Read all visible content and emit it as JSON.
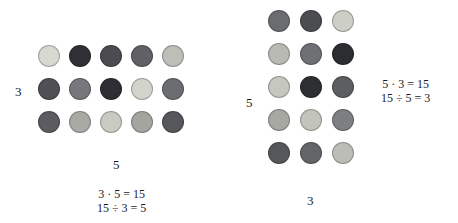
{
  "diagram": {
    "type": "array-model-multiplication",
    "left_array": {
      "rows": 3,
      "cols": 5,
      "row_label": "3",
      "col_label": "5",
      "equations": [
        "3 · 5 = 15",
        "15 ÷ 3 = 5"
      ],
      "dot_colors": [
        [
          "#d8d8d0",
          "#2f3033",
          "#4a4c50",
          "#5f6165",
          "#bdbeb8"
        ],
        [
          "#4e5054",
          "#76787c",
          "#2e2f32",
          "#d2d3cb",
          "#6b6d71"
        ],
        [
          "#5a5c60",
          "#a9aaa4",
          "#c9cac2",
          "#a4a59f",
          "#55575b"
        ]
      ]
    },
    "right_array": {
      "rows": 5,
      "cols": 3,
      "row_label": "5",
      "col_label": "3",
      "equations": [
        "5 · 3 = 15",
        "15 ÷ 5 = 3"
      ],
      "dot_colors": [
        [
          "#6a6c70",
          "#4b4d51",
          "#cdcec6"
        ],
        [
          "#b9bab4",
          "#6e7074",
          "#2c2d30"
        ],
        [
          "#c6c7bf",
          "#2e2f32",
          "#5c5e62"
        ],
        [
          "#a7a8a2",
          "#c3c4bc",
          "#7d7f83"
        ],
        [
          "#55575b",
          "#636569",
          "#bcbdb7"
        ]
      ]
    }
  }
}
